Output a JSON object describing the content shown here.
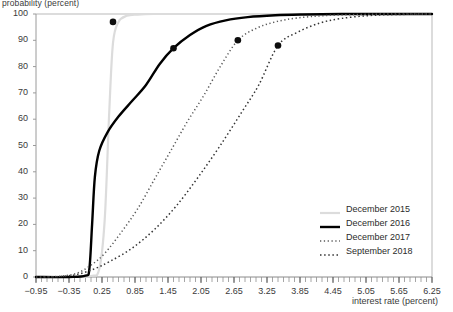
{
  "chart_data": {
    "type": "line",
    "title": "",
    "xlabel": "interest rate (percent)",
    "ylabel": "probability (percent)",
    "xlim": [
      -0.95,
      6.25
    ],
    "ylim": [
      0,
      100
    ],
    "grid": false,
    "legend_position": "bottom-right",
    "xticks": [
      "−0.95",
      "−0.35",
      "0.25",
      "0.85",
      "1.45",
      "2.05",
      "2.65",
      "3.25",
      "3.85",
      "4.45",
      "5.05",
      "5.65",
      "6.25"
    ],
    "xtick_values": [
      -0.95,
      -0.35,
      0.25,
      0.85,
      1.45,
      2.05,
      2.65,
      3.25,
      3.85,
      4.45,
      5.05,
      5.65,
      6.25
    ],
    "yticks": [
      "0",
      "10",
      "20",
      "30",
      "40",
      "50",
      "60",
      "70",
      "80",
      "90",
      "100"
    ],
    "ytick_values": [
      0,
      10,
      20,
      30,
      40,
      50,
      60,
      70,
      80,
      90,
      100
    ],
    "series": [
      {
        "name": "December 2015",
        "color": "#dcdcdc",
        "style": "solid",
        "width": 2.2,
        "marker": {
          "x": 0.45,
          "y": 97
        },
        "x": [
          -0.95,
          -0.35,
          0.05,
          0.2,
          0.3,
          0.38,
          0.45,
          0.55,
          0.7,
          0.9,
          1.2,
          1.8,
          2.65,
          3.85,
          5.05,
          6.25
        ],
        "y": [
          0,
          0,
          0.4,
          3,
          22,
          62,
          89,
          97,
          99.3,
          99.8,
          100,
          100,
          100,
          100,
          100,
          100
        ]
      },
      {
        "name": "December 2016",
        "color": "#000000",
        "style": "solid",
        "width": 2.4,
        "marker": {
          "x": 1.55,
          "y": 87
        },
        "x": [
          -0.95,
          -0.35,
          -0.05,
          0.02,
          0.07,
          0.12,
          0.2,
          0.35,
          0.55,
          0.8,
          1.05,
          1.3,
          1.55,
          1.85,
          2.15,
          2.5,
          2.9,
          3.4,
          3.9,
          4.6,
          5.4,
          6.25
        ],
        "y": [
          0,
          0,
          0.5,
          3,
          20,
          38,
          48,
          55,
          61,
          67,
          73,
          81,
          87,
          92,
          95.5,
          97.6,
          98.8,
          99.5,
          99.8,
          100,
          100,
          100
        ]
      },
      {
        "name": "December 2017",
        "color": "#5a5a5a",
        "style": "dotted-fine",
        "width": 1.5,
        "marker": {
          "x": 2.72,
          "y": 90
        },
        "x": [
          -0.95,
          -0.5,
          -0.2,
          0.05,
          0.3,
          0.6,
          0.9,
          1.2,
          1.5,
          1.8,
          2.1,
          2.4,
          2.72,
          3.05,
          3.4,
          3.8,
          4.3,
          4.9,
          5.5,
          6.25
        ],
        "y": [
          0,
          0.3,
          1.5,
          4.5,
          9,
          17,
          26,
          37,
          48,
          59,
          69,
          80,
          90,
          94.5,
          97,
          98.5,
          99.4,
          99.8,
          100,
          100
        ]
      },
      {
        "name": "September 2018",
        "color": "#333333",
        "style": "dotted",
        "width": 1.5,
        "marker": {
          "x": 3.45,
          "y": 88
        },
        "x": [
          -0.95,
          -0.5,
          -0.2,
          0.1,
          0.4,
          0.8,
          1.2,
          1.6,
          2.0,
          2.4,
          2.8,
          3.1,
          3.45,
          3.8,
          4.2,
          4.6,
          5.1,
          5.6,
          6.25
        ],
        "y": [
          0,
          0.2,
          1,
          3,
          6,
          11,
          18,
          27,
          38,
          50,
          63,
          73,
          88,
          93,
          96.5,
          98.3,
          99.4,
          99.8,
          100
        ]
      }
    ]
  },
  "axes": {
    "xlabel": "interest rate (percent)",
    "ylabel": "probability (percent)"
  },
  "legend": {
    "items": [
      {
        "label": "December 2015"
      },
      {
        "label": "December 2016"
      },
      {
        "label": "December 2017"
      },
      {
        "label": "September 2018"
      }
    ]
  }
}
